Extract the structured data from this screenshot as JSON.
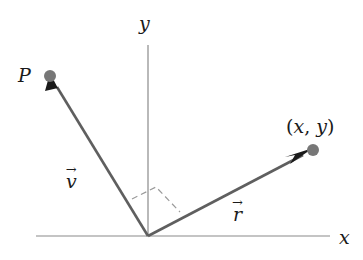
{
  "figure": {
    "background_color": "#ffffff",
    "width": 363,
    "height": 260
  },
  "axes": {
    "x_label": "x",
    "y_label": "y",
    "axis_color": "#8a8a8a",
    "x_axis": {
      "x1": 36,
      "y1": 236,
      "x2": 330,
      "y2": 236
    },
    "y_axis": {
      "x1": 148,
      "y1": 45,
      "x2": 148,
      "y2": 236
    },
    "origin": {
      "x": 148,
      "y": 236
    }
  },
  "vectors": [
    {
      "name": "v",
      "label": "v",
      "accent": "arrow",
      "color": "#5f5f5f",
      "from": {
        "x": 148,
        "y": 236
      },
      "to": {
        "x": 50,
        "y": 76
      },
      "label_position": {
        "x": 66,
        "y": 172
      },
      "endpoint_label": "P",
      "endpoint_dot_color": "#777777"
    },
    {
      "name": "r",
      "label": "r",
      "accent": "arrow",
      "color": "#5f5f5f",
      "from": {
        "x": 148,
        "y": 236
      },
      "to": {
        "x": 313,
        "y": 150
      },
      "label_position": {
        "x": 233,
        "y": 205
      },
      "endpoint_label": "(x, y)",
      "endpoint_dot_color": "#777777"
    }
  ],
  "annotations": {
    "right_angle": {
      "name": "right-angle-marker",
      "style": "dashed-square",
      "color": "#9a9a9a",
      "points": "132,199 156,187 180,212"
    }
  },
  "labels": {
    "point_p": "P",
    "point_xy": "(x, y)",
    "point_xy_parts": {
      "open": "(",
      "x": "x",
      "comma": ", ",
      "y": "y",
      "close": ")"
    },
    "vector_v": "v",
    "vector_r": "r",
    "vector_accent": "→",
    "axis_x": "x",
    "axis_y": "y"
  }
}
